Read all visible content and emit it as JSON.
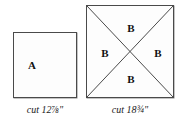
{
  "figure": {
    "background_color": "#ffffff",
    "line_color": "#4a4a4a",
    "text_color": "#111111"
  },
  "pieces": [
    {
      "id": "square-a",
      "shape": "square",
      "piece_letter": "A",
      "subdivisions": 0,
      "caption": "cut 12⅞\"",
      "cut_size_inches": "12 7/8"
    },
    {
      "id": "square-b",
      "shape": "square-with-both-diagonals",
      "piece_letter": "B",
      "subdivisions": 4,
      "caption": "cut 18¾\"",
      "cut_size_inches": "18 3/4",
      "triangle_labels": {
        "top": "B",
        "left": "B",
        "right": "B",
        "bottom": "B"
      }
    }
  ],
  "labels": {
    "a": "A",
    "b_top": "B",
    "b_left": "B",
    "b_right": "B",
    "b_bottom": "B"
  },
  "captions": {
    "left": "cut 12⅞\"",
    "right": "cut 18¾\""
  }
}
